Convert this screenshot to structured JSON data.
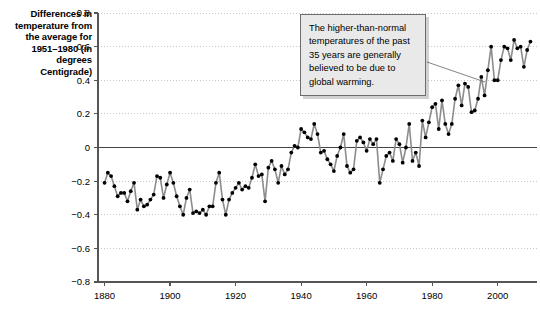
{
  "axis_caption": "Differences in temperature from the average for 1951–1980 (in degrees Centigrade)",
  "annotation": {
    "text": "The higher-than-normal temperatures of the past 35 years are generally believed to be due to global warming."
  },
  "colors": {
    "line": "#8c8c8c",
    "marker": "#000000",
    "grid": "#c8c8c8",
    "axis": "#555555",
    "zero_line": "#444444",
    "box_fill": "#e9e9e9",
    "box_border": "#6d6d6d"
  },
  "chart_data": {
    "type": "line",
    "title": "",
    "xlabel": "",
    "ylabel": "Differences in temperature from the average for 1951–1980 (in degrees Centigrade)",
    "xlim": [
      1878,
      2012
    ],
    "ylim": [
      -0.8,
      0.8
    ],
    "xticks": [
      1880,
      1900,
      1920,
      1940,
      1960,
      1980,
      2000
    ],
    "yticks": [
      -0.8,
      -0.6,
      -0.4,
      -0.2,
      0,
      0.2,
      0.4,
      0.6,
      0.8
    ],
    "ytick_labels": [
      "−0.8",
      "−0.6",
      "−0.4",
      "−0.2",
      "0",
      "0.2",
      "0.4",
      "0.6",
      "0.8"
    ],
    "xtick_labels": [
      "1880",
      "1900",
      "1920",
      "1940",
      "1960",
      "1980",
      "2000"
    ],
    "grid": true,
    "zero_line": true,
    "markers": true,
    "legend": false,
    "x": [
      1880,
      1881,
      1882,
      1883,
      1884,
      1885,
      1886,
      1887,
      1888,
      1889,
      1890,
      1891,
      1892,
      1893,
      1894,
      1895,
      1896,
      1897,
      1898,
      1899,
      1900,
      1901,
      1902,
      1903,
      1904,
      1905,
      1906,
      1907,
      1908,
      1909,
      1910,
      1911,
      1912,
      1913,
      1914,
      1915,
      1916,
      1917,
      1918,
      1919,
      1920,
      1921,
      1922,
      1923,
      1924,
      1925,
      1926,
      1927,
      1928,
      1929,
      1930,
      1931,
      1932,
      1933,
      1934,
      1935,
      1936,
      1937,
      1938,
      1939,
      1940,
      1941,
      1942,
      1943,
      1944,
      1945,
      1946,
      1947,
      1948,
      1949,
      1950,
      1951,
      1952,
      1953,
      1954,
      1955,
      1956,
      1957,
      1958,
      1959,
      1960,
      1961,
      1962,
      1963,
      1964,
      1965,
      1966,
      1967,
      1968,
      1969,
      1970,
      1971,
      1972,
      1973,
      1974,
      1975,
      1976,
      1977,
      1978,
      1979,
      1980,
      1981,
      1982,
      1983,
      1984,
      1985,
      1986,
      1987,
      1988,
      1989,
      1990,
      1991,
      1992,
      1993,
      1994,
      1995,
      1996,
      1997,
      1998,
      1999,
      2000,
      2001,
      2002,
      2003,
      2004,
      2005,
      2006,
      2007,
      2008,
      2009,
      2010
    ],
    "values": [
      -0.21,
      -0.15,
      -0.17,
      -0.23,
      -0.29,
      -0.27,
      -0.27,
      -0.32,
      -0.26,
      -0.21,
      -0.37,
      -0.31,
      -0.35,
      -0.34,
      -0.31,
      -0.28,
      -0.17,
      -0.18,
      -0.3,
      -0.22,
      -0.15,
      -0.21,
      -0.29,
      -0.35,
      -0.4,
      -0.3,
      -0.25,
      -0.39,
      -0.38,
      -0.39,
      -0.37,
      -0.4,
      -0.35,
      -0.35,
      -0.21,
      -0.15,
      -0.31,
      -0.4,
      -0.31,
      -0.27,
      -0.24,
      -0.21,
      -0.25,
      -0.23,
      -0.24,
      -0.18,
      -0.1,
      -0.17,
      -0.16,
      -0.32,
      -0.12,
      -0.08,
      -0.13,
      -0.21,
      -0.11,
      -0.16,
      -0.13,
      -0.03,
      0.01,
      0.0,
      0.11,
      0.09,
      0.06,
      0.05,
      0.14,
      0.08,
      -0.03,
      -0.02,
      -0.07,
      -0.1,
      -0.14,
      -0.05,
      0.0,
      0.08,
      -0.11,
      -0.15,
      -0.13,
      0.04,
      0.06,
      0.03,
      -0.02,
      0.05,
      0.02,
      0.05,
      -0.21,
      -0.13,
      -0.05,
      -0.03,
      -0.08,
      0.05,
      0.02,
      -0.09,
      0.0,
      0.14,
      -0.08,
      -0.03,
      -0.11,
      0.16,
      0.06,
      0.15,
      0.24,
      0.26,
      0.11,
      0.28,
      0.14,
      0.08,
      0.14,
      0.29,
      0.37,
      0.25,
      0.38,
      0.36,
      0.21,
      0.22,
      0.29,
      0.42,
      0.31,
      0.46,
      0.6,
      0.4,
      0.4,
      0.52,
      0.6,
      0.59,
      0.52,
      0.64,
      0.59,
      0.6,
      0.48,
      0.58,
      0.63
    ]
  }
}
